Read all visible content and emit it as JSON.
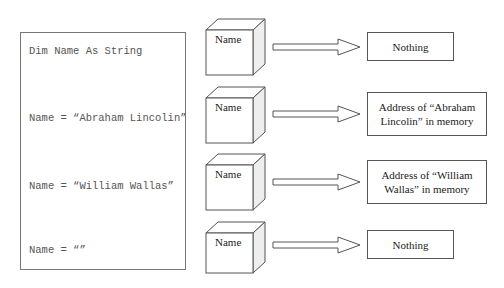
{
  "code": {
    "lines": [
      "Dim Name As String",
      "Name = “Abraham Lincolin”",
      "Name = “William Wallas”",
      "Name = “”"
    ]
  },
  "rows": [
    {
      "variable": "Name",
      "value": "Nothing"
    },
    {
      "variable": "Name",
      "value": "Address of “Abraham Lincolin” in memory"
    },
    {
      "variable": "Name",
      "value": "Address of “William Wallas” in memory"
    },
    {
      "variable": "Name",
      "value": "Nothing"
    }
  ]
}
